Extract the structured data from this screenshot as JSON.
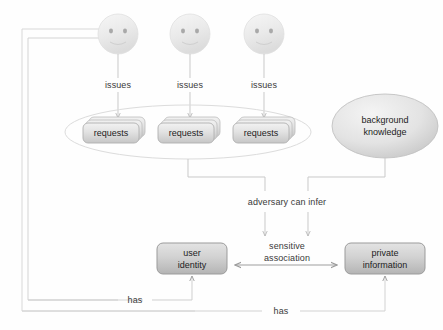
{
  "diagram": {
    "colors": {
      "line": "#c9c9c9",
      "line_dark": "#a8a8a8",
      "text": "#333333",
      "node_fill_light": "#e9e9e9",
      "node_fill_dark": "#cfcfcf",
      "node_stroke": "#9e9e9e",
      "face_fill": "#ebebeb",
      "ellipse_stroke": "#d4d4d4"
    },
    "actors": [
      {
        "name": "user-1",
        "cx": 118,
        "cy": 34,
        "r": 20
      },
      {
        "name": "user-2",
        "cx": 190,
        "cy": 34,
        "r": 20
      },
      {
        "name": "user-3",
        "cx": 264,
        "cy": 34,
        "r": 20
      }
    ],
    "edge_labels": {
      "issues_1": "issues",
      "issues_2": "issues",
      "issues_3": "issues",
      "adversary_can_infer": "adversary can infer",
      "sensitive_association": "sensitive\nassociation",
      "sensitive_association_line1": "sensitive",
      "sensitive_association_line2": "association",
      "has_left": "has",
      "has_right": "has"
    },
    "request_stacks": [
      {
        "name": "requests-stack-1",
        "label": "requests",
        "x": 85,
        "y": 122,
        "w": 56,
        "h": 21
      },
      {
        "name": "requests-stack-2",
        "label": "requests",
        "x": 160,
        "y": 122,
        "w": 56,
        "h": 21
      },
      {
        "name": "requests-stack-3",
        "label": "requests",
        "x": 235,
        "y": 122,
        "w": 56,
        "h": 21
      }
    ],
    "group_ellipse": {
      "name": "requests-group",
      "cx": 188,
      "cy": 132,
      "rx": 123,
      "ry": 27
    },
    "background_knowledge": {
      "name": "background-knowledge",
      "label_line1": "background",
      "label_line2": "knowledge",
      "cx": 385,
      "cy": 126,
      "rx": 53,
      "ry": 32
    },
    "boxes": [
      {
        "name": "user-identity",
        "label_line1": "user",
        "label_line2": "identity",
        "x": 157,
        "y": 243,
        "w": 70,
        "h": 31
      },
      {
        "name": "private-information",
        "label_line1": "private",
        "label_line2": "information",
        "x": 345,
        "y": 243,
        "w": 80,
        "h": 31
      }
    ]
  }
}
